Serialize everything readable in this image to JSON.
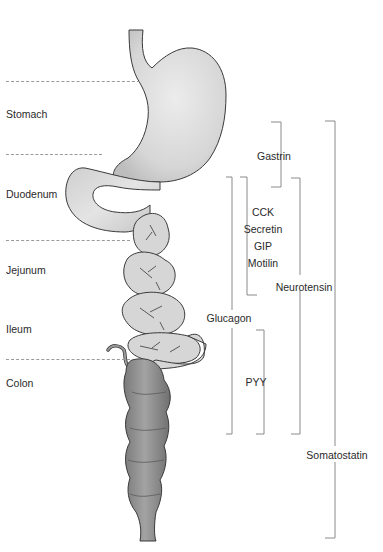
{
  "regions": [
    {
      "id": "stomach",
      "label": "Stomach",
      "x": 6,
      "y": 108
    },
    {
      "id": "duodenum",
      "label": "Duodenum",
      "x": 6,
      "y": 188
    },
    {
      "id": "jejunum",
      "label": "Jejunum",
      "x": 6,
      "y": 264
    },
    {
      "id": "ileum",
      "label": "Ileum",
      "x": 6,
      "y": 323
    },
    {
      "id": "colon",
      "label": "Colon",
      "x": 6,
      "y": 377
    }
  ],
  "dividers": [
    {
      "y": 81,
      "x1": 6,
      "x2": 140
    },
    {
      "y": 154,
      "x1": 6,
      "x2": 100
    },
    {
      "y": 240,
      "x1": 6,
      "x2": 128
    },
    {
      "y": 359,
      "x1": 6,
      "x2": 128
    }
  ],
  "hormones": {
    "gastrin": {
      "label": "Gastrin",
      "x": 270,
      "y": 150
    },
    "cck": {
      "label": "CCK",
      "x": 262,
      "y": 207
    },
    "secretin": {
      "label": "Secretin",
      "x": 262,
      "y": 224
    },
    "gip": {
      "label": "GIP",
      "x": 262,
      "y": 241
    },
    "motilin": {
      "label": "Motilin",
      "x": 262,
      "y": 258
    },
    "neurotensin": {
      "label": "Neurotensin",
      "x": 302,
      "y": 282
    },
    "glucagon": {
      "label": "Glucagon",
      "x": 228,
      "y": 318
    },
    "pyy": {
      "label": "PYY",
      "x": 254,
      "y": 378
    },
    "somatostatin": {
      "label": "Somatostatin",
      "x": 333,
      "y": 453
    }
  },
  "brackets": [
    {
      "name": "gastrin",
      "x": 281,
      "y1": 122,
      "y2": 187,
      "open": "left",
      "top_tick": true,
      "bottom_tick": true
    },
    {
      "name": "cck-secretin-gip-motilin",
      "x": 247,
      "y1": 177,
      "y2": 295,
      "open": "left",
      "note": "top-left and bottom-right ticks"
    },
    {
      "name": "neurotensin",
      "x": 300,
      "y1": 178,
      "y2": 434,
      "open": "left"
    },
    {
      "name": "glucagon",
      "x": 232,
      "y1": 177,
      "y2": 434,
      "open": "right"
    },
    {
      "name": "pyy",
      "x": 264,
      "y1": 330,
      "y2": 434,
      "open": "left"
    },
    {
      "name": "somatostatin",
      "x": 335,
      "y1": 121,
      "y2": 538,
      "open": "left"
    }
  ],
  "colors": {
    "organ_fill": "#d9d9d9",
    "organ_stroke": "#3a3a3a",
    "colon_fill": "#8c8c8c",
    "bracket": "#8a8a8a",
    "divider": "#9a9a9a",
    "text": "#2a2a2a"
  }
}
